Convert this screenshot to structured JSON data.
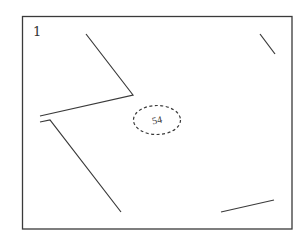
{
  "diagram": {
    "frame_label": "1",
    "circle_label": "54",
    "colors": {
      "stroke": "#3a3a3a",
      "background": "#ffffff"
    },
    "frame": {
      "x": 22.5,
      "y": 16.5,
      "width": 269.5,
      "height": 212.5
    },
    "lines": [
      {
        "id": "polyline-upper-left",
        "points": "86,34 133,95 40,116"
      },
      {
        "id": "polyline-lower-left",
        "points": "40,122 50,120 121,212"
      },
      {
        "id": "segment-top-right",
        "points": "260,34 275,54"
      },
      {
        "id": "segment-bottom-right",
        "points": "221,212 274,200"
      }
    ],
    "dashed_ellipse": {
      "cx": 157,
      "cy": 120,
      "rx": 23.5,
      "ry": 14.5
    }
  }
}
